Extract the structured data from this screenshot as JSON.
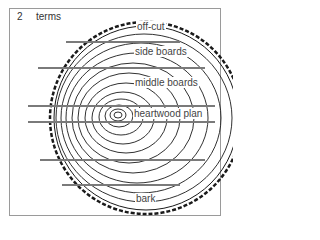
{
  "figure": {
    "number": "2",
    "title": "terms"
  },
  "labels": {
    "off_cut": "off-cut",
    "side_boards": "side boards",
    "middle_boards": "middle boards",
    "heartwood_plank": "heartwood plan",
    "bark": "bark"
  },
  "colors": {
    "ink": "#1a1a1a",
    "frame": "#9a9a9a",
    "text": "#444444"
  }
}
